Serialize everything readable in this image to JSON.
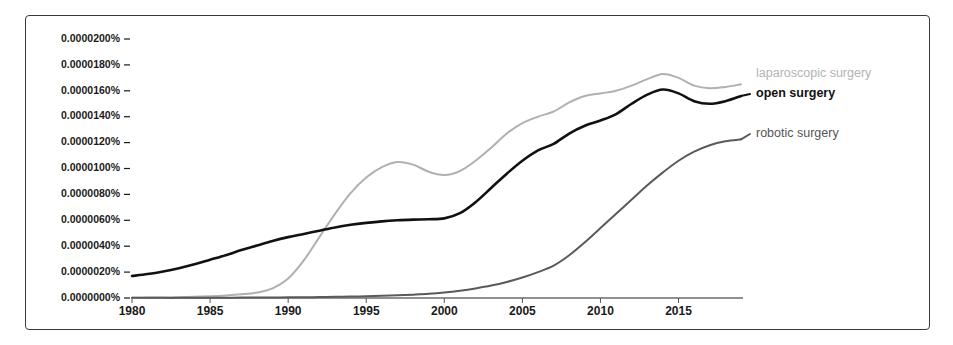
{
  "chart_data": {
    "type": "line",
    "title": "",
    "xlabel": "",
    "ylabel": "",
    "xlim": [
      1980,
      2019
    ],
    "ylim": [
      0.0,
      2e-05
    ],
    "grid": false,
    "legend_position": "right-inline",
    "x_tick_labels": [
      "1980",
      "1985",
      "1990",
      "1995",
      "2000",
      "2005",
      "2010",
      "2015"
    ],
    "x_tick_values": [
      1980,
      1985,
      1990,
      1995,
      2000,
      2005,
      2010,
      2015
    ],
    "y_tick_labels": [
      "0.0000200%",
      "0.0000180%",
      "0.0000160%",
      "0.0000140%",
      "0.0000120%",
      "0.0000100%",
      "0.0000080%",
      "0.0000060%",
      "0.0000040%",
      "0.0000020%",
      "0.0000000%"
    ],
    "y_tick_values": [
      2e-05,
      1.8e-05,
      1.6e-05,
      1.4e-05,
      1.2e-05,
      1e-05,
      8e-06,
      6e-06,
      4e-06,
      2e-06,
      0.0
    ],
    "x": [
      1980,
      1981,
      1982,
      1983,
      1984,
      1985,
      1986,
      1987,
      1988,
      1989,
      1990,
      1991,
      1992,
      1993,
      1994,
      1995,
      1996,
      1997,
      1998,
      1999,
      2000,
      2001,
      2002,
      2003,
      2004,
      2005,
      2006,
      2007,
      2008,
      2009,
      2010,
      2011,
      2012,
      2013,
      2014,
      2015,
      2016,
      2017,
      2018,
      2019
    ],
    "series": [
      {
        "name": "laparoscopic surgery",
        "color": "#b0b0b0",
        "label": "laparoscopic surgery",
        "values": [
          2e-08,
          3e-08,
          4e-08,
          6e-08,
          9e-08,
          1.3e-07,
          1.9e-07,
          2.8e-07,
          4.2e-07,
          7.5e-07,
          1.5e-06,
          2.9e-06,
          4.7e-06,
          6.5e-06,
          8.1e-06,
          9.3e-06,
          1.01e-05,
          1.05e-05,
          1.03e-05,
          9.75e-06,
          9.5e-06,
          9.8e-06,
          1.06e-05,
          1.16e-05,
          1.27e-05,
          1.35e-05,
          1.4e-05,
          1.44e-05,
          1.51e-05,
          1.56e-05,
          1.58e-05,
          1.6e-05,
          1.64e-05,
          1.69e-05,
          1.73e-05,
          1.7e-05,
          1.64e-05,
          1.62e-05,
          1.63e-05,
          1.65e-05
        ]
      },
      {
        "name": "open surgery",
        "color": "#111111",
        "label": "open surgery",
        "values": [
          1.7e-06,
          1.85e-06,
          2.05e-06,
          2.3e-06,
          2.6e-06,
          2.95e-06,
          3.3e-06,
          3.7e-06,
          4.05e-06,
          4.4e-06,
          4.7e-06,
          4.95e-06,
          5.2e-06,
          5.45e-06,
          5.65e-06,
          5.8e-06,
          5.92e-06,
          6e-06,
          6.05e-06,
          6.08e-06,
          6.15e-06,
          6.55e-06,
          7.4e-06,
          8.5e-06,
          9.6e-06,
          1.06e-05,
          1.14e-05,
          1.19e-05,
          1.27e-05,
          1.33e-05,
          1.37e-05,
          1.42e-05,
          1.5e-05,
          1.57e-05,
          1.61e-05,
          1.58e-05,
          1.52e-05,
          1.5e-05,
          1.52e-05,
          1.56e-05
        ]
      },
      {
        "name": "robotic surgery",
        "color": "#5a5a5a",
        "label": "robotic surgery",
        "values": [
          1e-08,
          1e-08,
          1e-08,
          1e-08,
          2e-08,
          2e-08,
          2e-08,
          3e-08,
          3e-08,
          4e-08,
          5e-08,
          6e-08,
          7e-08,
          9e-08,
          1.1e-07,
          1.4e-07,
          1.7e-07,
          2.1e-07,
          2.6e-07,
          3.2e-07,
          4.2e-07,
          5.6e-07,
          7.4e-07,
          9.6e-07,
          1.24e-06,
          1.58e-06,
          2e-06,
          2.5e-06,
          3.3e-06,
          4.3e-06,
          5.4e-06,
          6.5e-06,
          7.6e-06,
          8.7e-06,
          9.7e-06,
          1.06e-05,
          1.13e-05,
          1.18e-05,
          1.21e-05,
          1.225e-05
        ]
      }
    ]
  },
  "legend": {
    "laparoscopic": "laparoscopic surgery",
    "open": "open surgery",
    "robotic": "robotic surgery"
  }
}
